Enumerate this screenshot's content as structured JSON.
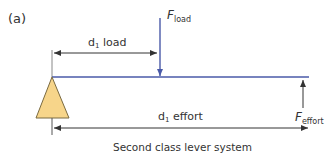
{
  "panel_label": "(a)",
  "caption": "Second class lever system",
  "load_force": {
    "symbol": "F",
    "subscript": "load",
    "direction": "down"
  },
  "effort_force": {
    "symbol": "F",
    "subscript": "effort",
    "direction": "up"
  },
  "load_distance": {
    "symbol": "d",
    "subscript": "1",
    "text": "load"
  },
  "effort_distance": {
    "symbol": "d",
    "subscript": "1",
    "text": "effort"
  },
  "colors": {
    "beam": "#4a5aa8",
    "load_arrow": "#4a5aa8",
    "fulcrum_fill": "#f7d58a",
    "fulcrum_stroke": "#7a6a40",
    "dimension_lines": "#555555",
    "effort_arrow": "#333333"
  }
}
